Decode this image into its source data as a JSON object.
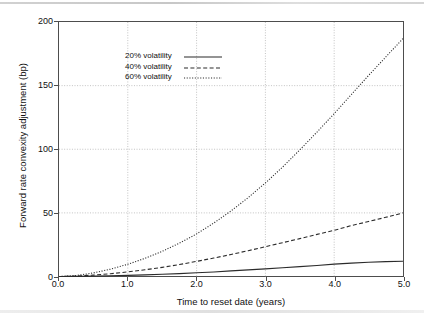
{
  "chart_data": {
    "type": "line",
    "title": "",
    "xlabel": "Time to reset date (years)",
    "ylabel": "Forward rate convexity adjustment (bp)",
    "xlim": [
      0.0,
      5.0
    ],
    "ylim": [
      0,
      200
    ],
    "xticks": [
      "0.0",
      "1.0",
      "2.0",
      "3.0",
      "4.0",
      "5.0"
    ],
    "xtick_values": [
      0.0,
      1.0,
      2.0,
      3.0,
      4.0,
      5.0
    ],
    "yticks": [
      "0",
      "50",
      "100",
      "150",
      "200"
    ],
    "ytick_values": [
      0,
      50,
      100,
      150,
      200
    ],
    "grid": true,
    "legend_position": "top-left",
    "x": [
      0.0,
      0.25,
      0.5,
      0.75,
      1.0,
      1.25,
      1.5,
      1.75,
      2.0,
      2.25,
      2.5,
      2.75,
      3.0,
      3.25,
      3.5,
      3.75,
      4.0,
      4.25,
      4.5,
      4.75,
      5.0
    ],
    "series": [
      {
        "name": "20% volatility",
        "style": "solid",
        "color": "#2b2b2b",
        "values": [
          0.0,
          0.1,
          0.3,
          0.6,
          0.9,
          1.3,
          1.8,
          2.3,
          3.0,
          3.6,
          4.4,
          5.2,
          6.0,
          6.9,
          7.8,
          8.7,
          9.7,
          10.5,
          11.2,
          11.7,
          12.0
        ]
      },
      {
        "name": "40% volatility",
        "style": "dashed",
        "color": "#2b2b2b",
        "values": [
          0.0,
          0.3,
          1.1,
          2.2,
          3.6,
          5.3,
          7.2,
          9.4,
          11.9,
          14.5,
          17.3,
          20.3,
          23.4,
          26.6,
          29.8,
          33.1,
          36.3,
          40.0,
          43.2,
          46.5,
          50.0
        ]
      },
      {
        "name": "60% volatility",
        "style": "dotted",
        "color": "#2b2b2b",
        "values": [
          0.0,
          0.8,
          2.8,
          5.8,
          9.6,
          14.3,
          19.8,
          26.2,
          33.5,
          42.0,
          51.5,
          62.0,
          73.5,
          86.0,
          99.5,
          113.5,
          128.0,
          143.0,
          158.0,
          172.5,
          187.0
        ]
      }
    ]
  },
  "axes": {
    "xlabel": "Time to reset date (years)",
    "ylabel": "Forward rate convexity adjustment (bp)"
  },
  "legend": {
    "items": [
      {
        "label": "20% volatility",
        "style": "solid"
      },
      {
        "label": "40% volatility",
        "style": "dashed"
      },
      {
        "label": "60% volatility",
        "style": "dotted"
      }
    ]
  }
}
